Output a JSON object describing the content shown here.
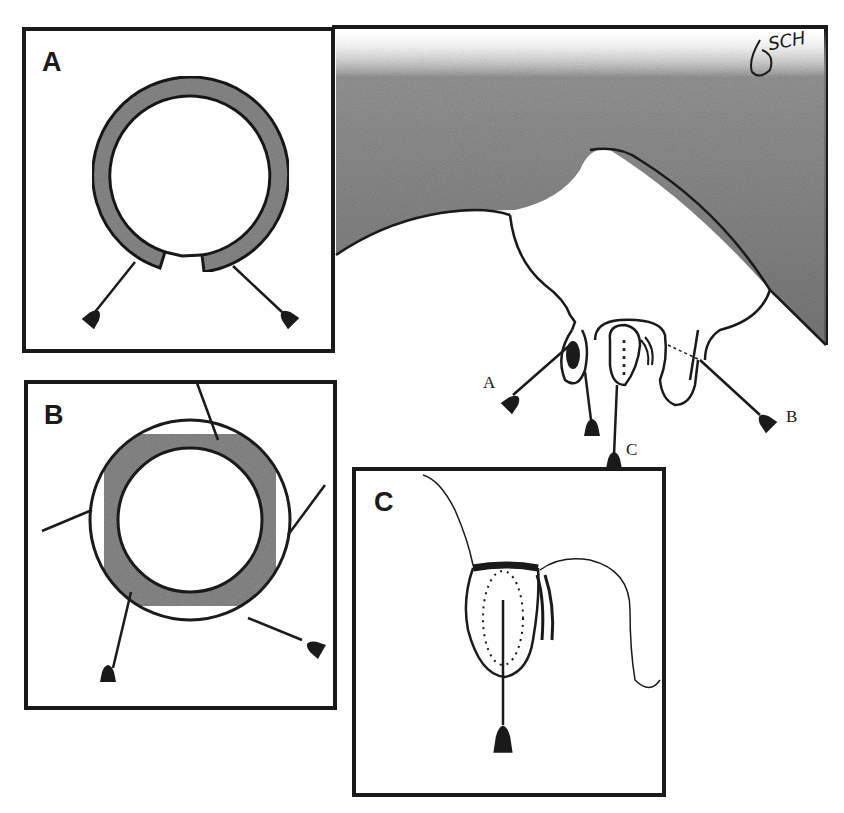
{
  "figure": {
    "panels": [
      {
        "id": "A",
        "label": "A",
        "description": "ring with gap at bottom, two needles inserted at the gap ends"
      },
      {
        "id": "B",
        "label": "B",
        "description": "complete ring with four needles passing through"
      },
      {
        "id": "C",
        "label": "C",
        "description": "teat cross-section with purse-string suture and central needle"
      }
    ],
    "main_illustration": {
      "description": "udder and teats with needle insertion sites",
      "callouts": [
        {
          "id": "A",
          "label": "A"
        },
        {
          "id": "B",
          "label": "B"
        },
        {
          "id": "C",
          "label": "C"
        }
      ],
      "signature": "SCH"
    },
    "colors": {
      "ink": "#1a1a1a",
      "shading": "#7a7a7a",
      "background": "#ffffff"
    }
  }
}
